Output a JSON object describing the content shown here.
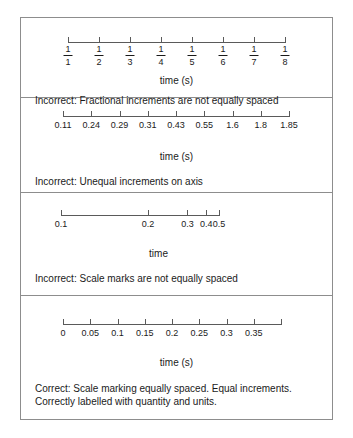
{
  "figure": {
    "panels": [
      {
        "id": "panel-fractional-increments",
        "axis_title": "time (s)",
        "caption": "Incorrect: Fractional increments are not equally spaced",
        "verdict": "Incorrect",
        "tick_style": "fraction",
        "ticks": [
          {
            "label": "1/1",
            "numerator": "1",
            "denominator": "1",
            "pos_pct": 0
          },
          {
            "label": "1/2",
            "numerator": "1",
            "denominator": "2",
            "pos_pct": 14.28
          },
          {
            "label": "1/3",
            "numerator": "1",
            "denominator": "3",
            "pos_pct": 28.57
          },
          {
            "label": "1/4",
            "numerator": "1",
            "denominator": "4",
            "pos_pct": 42.85
          },
          {
            "label": "1/5",
            "numerator": "1",
            "denominator": "5",
            "pos_pct": 57.14
          },
          {
            "label": "1/6",
            "numerator": "1",
            "denominator": "6",
            "pos_pct": 71.42
          },
          {
            "label": "1/7",
            "numerator": "1",
            "denominator": "7",
            "pos_pct": 85.71
          },
          {
            "label": "1/8",
            "numerator": "1",
            "denominator": "8",
            "pos_pct": 100
          }
        ]
      },
      {
        "id": "panel-unequal-increments",
        "axis_title": "time (s)",
        "caption": "Incorrect: Unequal increments on axis",
        "verdict": "Incorrect",
        "tick_style": "plain",
        "ticks": [
          {
            "label": "0.11",
            "pos_pct": 0
          },
          {
            "label": "0.24",
            "pos_pct": 12.5
          },
          {
            "label": "0.29",
            "pos_pct": 25
          },
          {
            "label": "0.31",
            "pos_pct": 37.5
          },
          {
            "label": "0.43",
            "pos_pct": 50
          },
          {
            "label": "0.55",
            "pos_pct": 62.5
          },
          {
            "label": "1.6",
            "pos_pct": 75
          },
          {
            "label": "1.8",
            "pos_pct": 87.5
          },
          {
            "label": "1.85",
            "pos_pct": 100
          }
        ]
      },
      {
        "id": "panel-unequal-scale-marks",
        "axis_title": "time",
        "caption": "Incorrect: Scale marks are not equally spaced",
        "verdict": "Incorrect",
        "tick_style": "plain",
        "ticks": [
          {
            "label": "0.1",
            "pos_pct": 0
          },
          {
            "label": "0.2",
            "pos_pct": 55
          },
          {
            "label": "0.3",
            "pos_pct": 80
          },
          {
            "label": "0.4",
            "pos_pct": 92
          },
          {
            "label": "0.5",
            "pos_pct": 100
          }
        ]
      },
      {
        "id": "panel-correct-scale",
        "axis_title": "time (s)",
        "caption": "Correct: Scale marking equally spaced. Equal increments. Correctly labelled with quantity and units.",
        "verdict": "Correct",
        "tick_style": "plain",
        "ticks": [
          {
            "label": "0",
            "pos_pct": 0
          },
          {
            "label": "0.05",
            "pos_pct": 12.5
          },
          {
            "label": "0.1",
            "pos_pct": 25
          },
          {
            "label": "0.15",
            "pos_pct": 37.5
          },
          {
            "label": "0.2",
            "pos_pct": 50
          },
          {
            "label": "0.25",
            "pos_pct": 62.5
          },
          {
            "label": "0.3",
            "pos_pct": 75
          },
          {
            "label": "0.35",
            "pos_pct": 87.5
          },
          {
            "label": "",
            "pos_pct": 100
          }
        ]
      }
    ]
  },
  "colors": {
    "frame": "#8d8d8d",
    "axis": "#5a5a5a",
    "text": "#1a1a1a",
    "background": "#ffffff"
  }
}
